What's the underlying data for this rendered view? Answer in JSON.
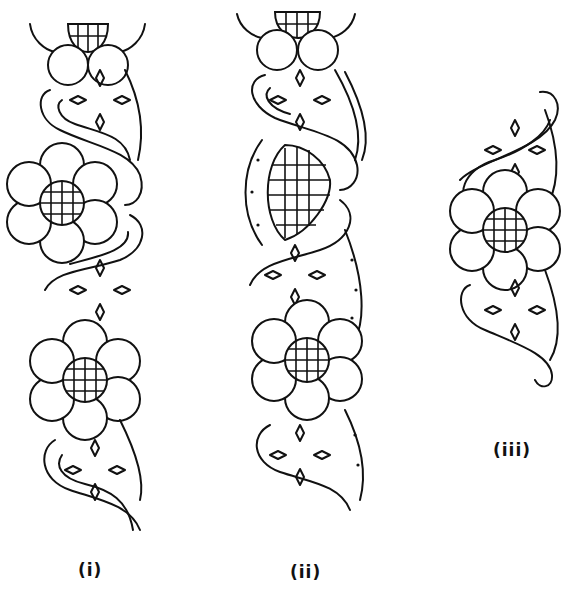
{
  "figure": {
    "panels": [
      {
        "id": "i",
        "label": "(i)",
        "elements": [
          "half-flower top",
          "scroll with diamond motifs",
          "flower with grid center",
          "scroll with diamond motifs",
          "flower with grid center",
          "scroll with diamond motifs"
        ]
      },
      {
        "id": "ii",
        "label": "(ii)",
        "elements": [
          "half-flower top",
          "scroll with diamond motifs",
          "dotted band",
          "large grid-filled leaf",
          "scroll with diamond motifs",
          "flower with grid center",
          "scroll with diamond motifs"
        ]
      },
      {
        "id": "iii",
        "label": "(iii)",
        "elements": [
          "scroll with diamond motifs",
          "flower with grid center",
          "scroll with diamond motifs"
        ]
      }
    ]
  }
}
